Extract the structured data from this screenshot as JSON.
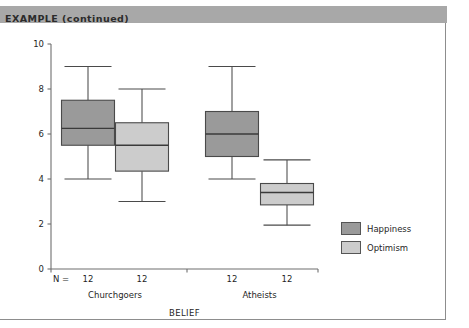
{
  "banner": {
    "label": "EXAMPLE (continued)",
    "bg_color": "#a8a8a8"
  },
  "legend": {
    "items": [
      {
        "label": "Happiness",
        "color": "#9a9a9a"
      },
      {
        "label": "Optimism",
        "color": "#cccccc"
      }
    ]
  },
  "chart_data": {
    "type": "box",
    "title": "",
    "xlabel": "BELIEF",
    "ylabel": "",
    "ylim": [
      0,
      10
    ],
    "yticks": [
      0,
      2,
      4,
      6,
      8,
      10
    ],
    "yticklabels": [
      "0",
      "2",
      "4",
      "6",
      "8",
      "10"
    ],
    "grid": false,
    "legend_position": "right",
    "n_label": "N =",
    "categories": [
      "Churchgoers",
      "Atheists"
    ],
    "n_values": [
      "12",
      "12",
      "12",
      "12"
    ],
    "series": [
      {
        "name": "Happiness",
        "color": "#9a9a9a",
        "boxes": [
          {
            "group": "Churchgoers",
            "whisker_low": 4.0,
            "q1": 5.5,
            "median": 6.25,
            "q3": 7.5,
            "whisker_high": 9.0
          },
          {
            "group": "Atheists",
            "whisker_low": 4.0,
            "q1": 5.0,
            "median": 6.0,
            "q3": 7.0,
            "whisker_high": 9.0
          }
        ]
      },
      {
        "name": "Optimism",
        "color": "#cccccc",
        "boxes": [
          {
            "group": "Churchgoers",
            "whisker_low": 3.0,
            "q1": 4.35,
            "median": 5.5,
            "q3": 6.5,
            "whisker_high": 8.0
          },
          {
            "group": "Atheists",
            "whisker_low": 1.95,
            "q1": 2.85,
            "median": 3.4,
            "q3": 3.8,
            "whisker_high": 4.85
          }
        ]
      }
    ]
  }
}
